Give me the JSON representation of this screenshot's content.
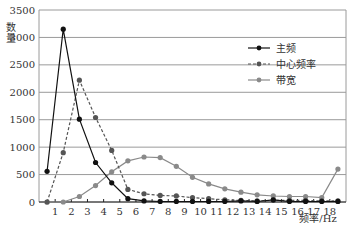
{
  "chart_data": {
    "type": "line",
    "title": "",
    "xlabel": "频率/Hz",
    "ylabel": "数量",
    "ylim": [
      0,
      3500
    ],
    "yticks": [
      0,
      500,
      1000,
      1500,
      2000,
      2500,
      3000,
      3500
    ],
    "xtick_labels": [
      "1",
      "2",
      "3",
      "4",
      "5",
      "6",
      "7",
      "8",
      "9",
      "10",
      "11",
      "12",
      "13",
      "14",
      "15",
      "16",
      "17",
      "18"
    ],
    "grid": "horizontal",
    "legend_position": "upper right",
    "point_count": 19,
    "series": [
      {
        "name": "主频",
        "style": "solid",
        "color": "#111111",
        "values": [
          560,
          3150,
          1510,
          720,
          350,
          60,
          20,
          10,
          10,
          10,
          10,
          10,
          20,
          10,
          40,
          10,
          10,
          10,
          10
        ]
      },
      {
        "name": "中心频率",
        "style": "dashed",
        "color": "#555555",
        "values": [
          0,
          900,
          2220,
          1540,
          940,
          230,
          150,
          120,
          110,
          80,
          60,
          40,
          30,
          20,
          30,
          30,
          30,
          20,
          20
        ]
      },
      {
        "name": "带宽",
        "style": "solid",
        "color": "#8a8a8a",
        "values": [
          0,
          0,
          100,
          300,
          550,
          750,
          820,
          810,
          650,
          450,
          330,
          240,
          180,
          130,
          110,
          100,
          100,
          80,
          600
        ]
      }
    ]
  }
}
